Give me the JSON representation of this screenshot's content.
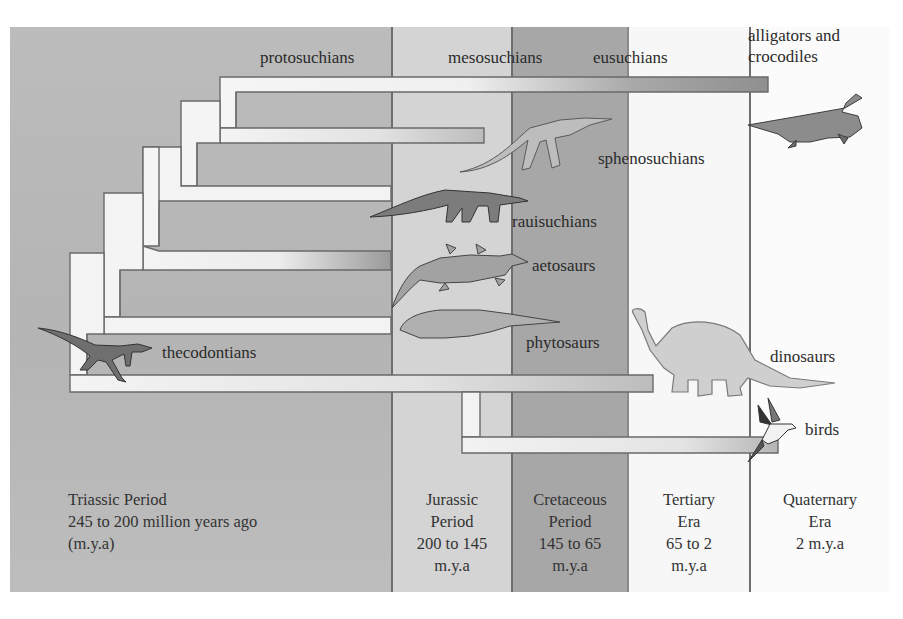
{
  "diagram": {
    "type": "phylogenetic-tree-over-geologic-time",
    "periods": [
      {
        "name": "Triassic Period",
        "range": "245 to 200 million years ago",
        "unit": "(m.y.a)",
        "color": "#b9b9b9"
      },
      {
        "name_line1": "Jurassic",
        "name_line2": "Period",
        "range": "200 to 145",
        "unit": "m.y.a",
        "color": "#d3d3d3"
      },
      {
        "name_line1": "Cretaceous",
        "name_line2": "Period",
        "range": "145 to 65",
        "unit": "m.y.a",
        "color": "#a6a6a6"
      },
      {
        "name_line1": "Tertiary",
        "name_line2": "Era",
        "range": "65 to 2",
        "unit": "m.y.a",
        "color": "#f6f6f6"
      },
      {
        "name_line1": "Quaternary",
        "name_line2": "Era",
        "range": "2 m.y.a",
        "color": "#fafafa"
      }
    ],
    "clade_labels": {
      "protosuchians": "protosuchians",
      "mesosuchians": "mesosuchians",
      "eusuchians": "eusuchians",
      "alligators_line1": "alligators and",
      "alligators_line2": "crocodiles",
      "sphenosuchians": "sphenosuchians",
      "rauisuchians": "rauisuchians",
      "aetosaurs": "aetosaurs",
      "phytosaurs": "phytosaurs",
      "thecodontians": "thecodontians",
      "dinosaurs": "dinosaurs",
      "birds": "birds"
    },
    "illustrations": [
      "crocodile-illustration",
      "sphenosuchian-illustration",
      "rauisuchian-illustration",
      "aetosaur-illustration",
      "phytosaur-illustration",
      "thecodont-illustration",
      "sauropod-dinosaur-illustration",
      "bird-illustration"
    ],
    "colors": {
      "branch_fill": "#f4f4f4",
      "branch_outline": "#6a6a6a",
      "divider": "#6e6e6e",
      "text": "#2b2b2b"
    }
  }
}
